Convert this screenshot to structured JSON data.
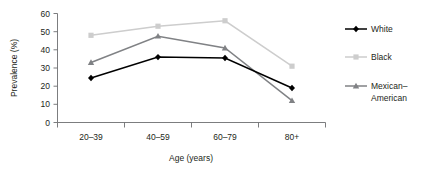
{
  "chart_data": {
    "type": "line",
    "title": "",
    "subtitle": "",
    "xlabel": "Age (years)",
    "ylabel": "Prevalence (%)",
    "categories": [
      "20–39",
      "40–59",
      "60–79",
      "80+"
    ],
    "ylim": [
      0,
      60
    ],
    "yticks": [
      0,
      10,
      20,
      30,
      40,
      50,
      60
    ],
    "ytick_labels": [
      "0",
      "10",
      "20",
      "30",
      "40",
      "50",
      "60"
    ],
    "grid": false,
    "legend_position": "right",
    "series": [
      {
        "name": "White",
        "values": [
          24.5,
          36,
          35.5,
          19
        ],
        "color": "#000000",
        "marker": "diamond"
      },
      {
        "name": "Black",
        "values": [
          48,
          53,
          56,
          31
        ],
        "color": "#cdcdcd",
        "marker": "square"
      },
      {
        "name": "Mexican–American",
        "values": [
          33,
          47.5,
          41,
          12
        ],
        "color": "#808285",
        "marker": "triangle"
      }
    ]
  },
  "axes": {
    "y_axis_title": "Prevalence (%)",
    "x_axis_title": "Age (years)",
    "y_tick_0": "0",
    "y_tick_10": "10",
    "y_tick_20": "20",
    "y_tick_30": "30",
    "y_tick_40": "40",
    "y_tick_50": "50",
    "y_tick_60": "60",
    "x_tick_0": "20–39",
    "x_tick_1": "40–59",
    "x_tick_2": "60–79",
    "x_tick_3": "80+"
  },
  "legend": {
    "entries": [
      {
        "label": "White",
        "line_2": ""
      },
      {
        "label": "Black",
        "line_2": ""
      },
      {
        "label": "Mexican–",
        "line_2": "American"
      }
    ]
  }
}
